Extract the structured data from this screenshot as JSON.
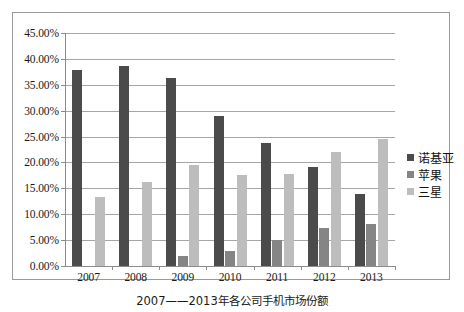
{
  "caption": "2007——2013年各公司手机市场份额",
  "legend": {
    "position": "right",
    "items": [
      {
        "label": "诺基亚",
        "color": "#4b4b4b"
      },
      {
        "label": "苹果",
        "color": "#858585"
      },
      {
        "label": "三星",
        "color": "#bdbdbd"
      }
    ]
  },
  "axis": {
    "y_ticks": [
      "0.00%",
      "5.00%",
      "10.00%",
      "15.00%",
      "20.00%",
      "25.00%",
      "30.00%",
      "35.00%",
      "40.00%",
      "45.00%"
    ],
    "y_min": 0,
    "y_max": 45,
    "y_step": 5,
    "x_ticks": [
      "2007",
      "2008",
      "2009",
      "2010",
      "2011",
      "2012",
      "2013"
    ]
  },
  "chart_data": {
    "type": "bar",
    "title": "",
    "subtitle": "",
    "xlabel": "",
    "ylabel": "",
    "ylim": [
      0,
      45
    ],
    "ytick_format": "percent",
    "grid": true,
    "legend_position": "right",
    "categories": [
      "2007",
      "2008",
      "2009",
      "2010",
      "2011",
      "2012",
      "2013"
    ],
    "series": [
      {
        "name": "诺基亚",
        "color": "#4b4b4b",
        "values": [
          37.8,
          38.6,
          36.3,
          28.9,
          23.8,
          19.1,
          13.9
        ]
      },
      {
        "name": "苹果",
        "color": "#858585",
        "values": [
          0,
          0,
          2.0,
          2.9,
          5.0,
          7.3,
          8.1
        ]
      },
      {
        "name": "三星",
        "color": "#bdbdbd",
        "values": [
          13.3,
          16.3,
          19.5,
          17.5,
          17.7,
          22.1,
          24.6
        ]
      }
    ]
  }
}
